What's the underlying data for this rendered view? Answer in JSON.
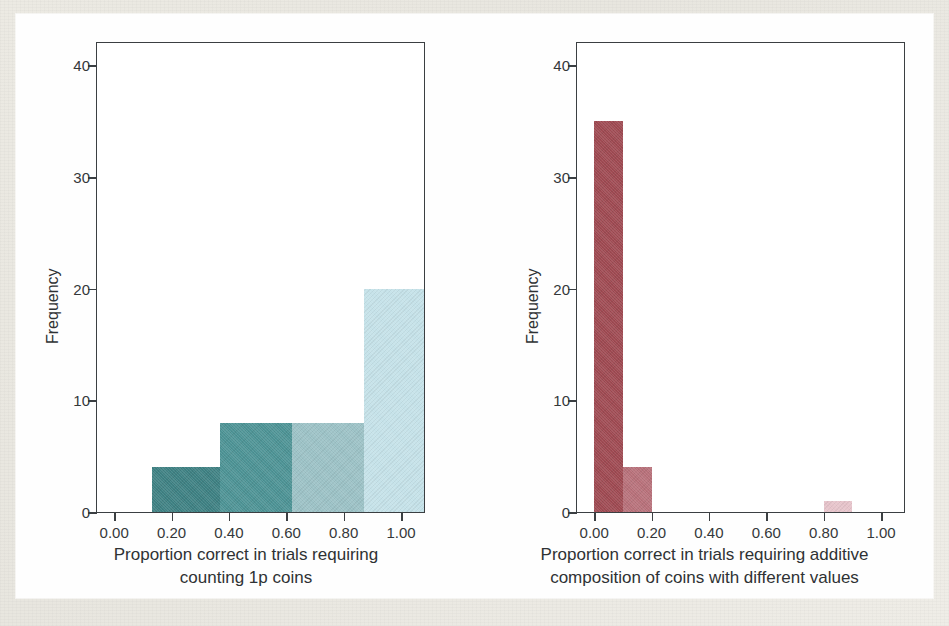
{
  "figure": {
    "background_color": "#ece9e2",
    "paper_color": "#fefefe",
    "axis_color": "#3b3f42"
  },
  "chart_data": [
    {
      "type": "bar",
      "panel": "left",
      "title": "",
      "xlabel_line1": "Proportion correct in trials requiring",
      "xlabel_line2": "counting 1p coins",
      "ylabel": "Frequency",
      "xlim": [
        -0.06,
        1.08
      ],
      "ylim": [
        0,
        42
      ],
      "xticks": [
        0.0,
        0.2,
        0.4,
        0.6,
        0.8,
        1.0
      ],
      "xticklabels": [
        "0.00",
        "0.20",
        "0.40",
        "0.60",
        "0.80",
        "1.00"
      ],
      "yticks": [
        0,
        10,
        20,
        30,
        40
      ],
      "yticklabels": [
        "0",
        "10",
        "20",
        "30",
        "40"
      ],
      "grid": false,
      "legend": "none",
      "bins": [
        {
          "x0": 0.13,
          "x1": 0.37,
          "value": 4,
          "color": "#3e8183"
        },
        {
          "x0": 0.37,
          "x1": 0.62,
          "value": 8,
          "color": "#4d9395"
        },
        {
          "x0": 0.62,
          "x1": 0.87,
          "value": 8,
          "color": "#9cc2c6"
        },
        {
          "x0": 0.87,
          "x1": 1.08,
          "value": 20,
          "color": "#c5e2e9"
        }
      ]
    },
    {
      "type": "bar",
      "panel": "right",
      "title": "",
      "xlabel_line1": "Proportion correct in trials requiring additive",
      "xlabel_line2": "composition of coins with different values",
      "ylabel": "Frequency",
      "xlim": [
        -0.06,
        1.08
      ],
      "ylim": [
        0,
        42
      ],
      "xticks": [
        0.0,
        0.2,
        0.4,
        0.6,
        0.8,
        1.0
      ],
      "xticklabels": [
        "0.00",
        "0.20",
        "0.40",
        "0.60",
        "0.80",
        "1.00"
      ],
      "yticks": [
        0,
        10,
        20,
        30,
        40
      ],
      "yticklabels": [
        "0",
        "10",
        "20",
        "30",
        "40"
      ],
      "grid": false,
      "legend": "none",
      "bins": [
        {
          "x0": 0.0,
          "x1": 0.1,
          "value": 35,
          "color": "#9f4a52"
        },
        {
          "x0": 0.1,
          "x1": 0.2,
          "value": 4,
          "color": "#b8717a"
        },
        {
          "x0": 0.8,
          "x1": 0.9,
          "value": 1,
          "color": "#e7c4cb"
        }
      ]
    }
  ]
}
